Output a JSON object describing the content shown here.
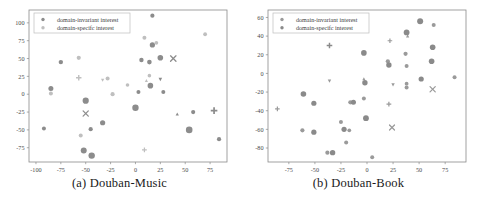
{
  "figure": {
    "background": "#ffffff",
    "panel_count": 2
  },
  "colors": {
    "invariant": "#8c8c8c",
    "specific": "#b8b8b8",
    "axis": "#8a8a8a",
    "text": "#3a3a3a",
    "legend_border": "#bdbdbd"
  },
  "legend": {
    "entries": [
      {
        "label": "domain-invariant interest",
        "marker": "circle",
        "color_key": "invariant"
      },
      {
        "label": "domain-specifc interest",
        "marker": "circle",
        "color_key": "specific"
      }
    ]
  },
  "chart_data": [
    {
      "type": "scatter",
      "panel": "a",
      "title": "(a) Douban-Music",
      "caption": "(a) Douban-Music",
      "xlabel": "",
      "ylabel": "",
      "grid": false,
      "legend_position": "upper-left",
      "xlim": [
        -107,
        92
      ],
      "ylim": [
        -95,
        118
      ],
      "xticks": [
        -100,
        -75,
        -50,
        -25,
        0,
        25,
        50,
        75
      ],
      "yticks": [
        100,
        75,
        50,
        25,
        0,
        -25,
        -50,
        -75
      ],
      "xticklabels": [
        "-100",
        "-75",
        "-50",
        "-25",
        "0",
        "25",
        "50",
        "75"
      ],
      "yticklabels": [
        "100",
        "75",
        "50",
        "25",
        "0",
        "-25",
        "-50",
        "-75"
      ],
      "series": [
        {
          "name": "domain-invariant interest",
          "color": "#8c8c8c",
          "points": [
            {
              "x": -85,
              "y": 8,
              "marker": "circle",
              "size": 5.0
            },
            {
              "x": -50,
              "y": -9,
              "marker": "circle",
              "size": 6.2
            },
            {
              "x": -52,
              "y": -79,
              "marker": "circle",
              "size": 6.0
            },
            {
              "x": -44,
              "y": -86,
              "marker": "circle",
              "size": 6.4
            },
            {
              "x": -33,
              "y": -40,
              "marker": "circle",
              "size": 5.2
            },
            {
              "x": 0,
              "y": -19,
              "marker": "circle",
              "size": 6.4
            },
            {
              "x": 15,
              "y": 12,
              "marker": "circle",
              "size": 5.6
            },
            {
              "x": 54,
              "y": -50,
              "marker": "circle",
              "size": 6.6
            },
            {
              "x": -50,
              "y": -27,
              "marker": "x",
              "size": 5.2
            },
            {
              "x": 38,
              "y": 50,
              "marker": "x",
              "size": 5.4
            },
            {
              "x": 25,
              "y": 21,
              "marker": "triangle-down",
              "size": 5.0
            },
            {
              "x": 42,
              "y": -28,
              "marker": "triangle-up",
              "size": 4.6
            },
            {
              "x": 79,
              "y": -23,
              "marker": "plus",
              "size": 6.6
            },
            {
              "x": 25,
              "y": 51,
              "marker": "circle",
              "size": 5.6
            },
            {
              "x": 17,
              "y": 69,
              "marker": "circle",
              "size": 5.2
            },
            {
              "x": 6,
              "y": 48,
              "marker": "circle",
              "size": 4.4
            },
            {
              "x": 14,
              "y": 45,
              "marker": "circle",
              "size": 4.6
            },
            {
              "x": -75,
              "y": 45,
              "marker": "circle",
              "size": 4.4
            },
            {
              "x": 3,
              "y": 3,
              "marker": "circle",
              "size": 4.0
            },
            {
              "x": 28,
              "y": 3,
              "marker": "circle",
              "size": 4.0
            },
            {
              "x": -45,
              "y": -49,
              "marker": "circle",
              "size": 4.2
            },
            {
              "x": -92,
              "y": -48,
              "marker": "circle",
              "size": 4.0
            },
            {
              "x": 58,
              "y": -25,
              "marker": "circle",
              "size": 4.2
            },
            {
              "x": 84,
              "y": -63,
              "marker": "circle",
              "size": 4.2
            },
            {
              "x": 17,
              "y": 110,
              "marker": "circle",
              "size": 4.2
            }
          ]
        },
        {
          "name": "domain-specifc interest",
          "color": "#bfbfbf",
          "points": [
            {
              "x": -85,
              "y": 1,
              "marker": "circle",
              "size": 4.0
            },
            {
              "x": -57,
              "y": 51,
              "marker": "circle",
              "size": 4.2
            },
            {
              "x": -57,
              "y": 23,
              "marker": "plus",
              "size": 5.4
            },
            {
              "x": -33,
              "y": 20,
              "marker": "triangle-down",
              "size": 4.6
            },
            {
              "x": -28,
              "y": 22,
              "marker": "circle",
              "size": 4.0
            },
            {
              "x": -23,
              "y": 0,
              "marker": "circle",
              "size": 4.2
            },
            {
              "x": -55,
              "y": -58,
              "marker": "circle",
              "size": 4.0
            },
            {
              "x": 9,
              "y": 79,
              "marker": "circle",
              "size": 4.0
            },
            {
              "x": 21,
              "y": 72,
              "marker": "circle",
              "size": 3.8
            },
            {
              "x": 11,
              "y": 19,
              "marker": "triangle-up",
              "size": 4.4
            },
            {
              "x": 14,
              "y": 26,
              "marker": "circle",
              "size": 3.6
            },
            {
              "x": 9,
              "y": -78,
              "marker": "plus",
              "size": 4.8
            },
            {
              "x": 70,
              "y": 84,
              "marker": "circle",
              "size": 3.8
            },
            {
              "x": -8,
              "y": 13,
              "marker": "circle",
              "size": 3.6
            }
          ]
        }
      ]
    },
    {
      "type": "scatter",
      "panel": "b",
      "title": "(b) Douban-Book",
      "caption": "(b) Douban-Book",
      "xlabel": "",
      "ylabel": "",
      "grid": false,
      "legend_position": "upper-left",
      "xlim": [
        -95,
        95
      ],
      "ylim": [
        -95,
        68
      ],
      "xticks": [
        -75,
        -50,
        -25,
        0,
        25,
        50,
        75
      ],
      "yticks": [
        60,
        40,
        20,
        0,
        -20,
        -40,
        -60,
        -80
      ],
      "xticklabels": [
        "-75",
        "-50",
        "-25",
        "0",
        "25",
        "50",
        "75"
      ],
      "yticklabels": [
        "60",
        "40",
        "20",
        "0",
        "-20",
        "-40",
        "-60",
        "-80"
      ],
      "series": [
        {
          "name": "domain-invariant interest",
          "color": "#9a9a9a",
          "points": [
            {
              "x": -86,
              "y": -38,
              "marker": "plus",
              "size": 4.6
            },
            {
              "x": -62,
              "y": -61,
              "marker": "circle",
              "size": 4.2
            },
            {
              "x": -16,
              "y": -31,
              "marker": "circle",
              "size": 4.2
            },
            {
              "x": -25,
              "y": -52,
              "marker": "circle",
              "size": 4.0
            },
            {
              "x": -20,
              "y": -74,
              "marker": "circle",
              "size": 4.0
            },
            {
              "x": -38,
              "y": -85,
              "marker": "circle",
              "size": 4.2
            },
            {
              "x": 5,
              "y": -90,
              "marker": "circle",
              "size": 4.0
            },
            {
              "x": 20,
              "y": 13,
              "marker": "circle",
              "size": 4.2
            },
            {
              "x": 22,
              "y": 35,
              "marker": "plus",
              "size": 4.6
            },
            {
              "x": 37,
              "y": 21,
              "marker": "circle",
              "size": 4.2
            },
            {
              "x": 38,
              "y": 8,
              "marker": "circle",
              "size": 4.0
            },
            {
              "x": 38,
              "y": -15,
              "marker": "circle",
              "size": 4.0
            },
            {
              "x": 21,
              "y": -33,
              "marker": "plus",
              "size": 4.8
            },
            {
              "x": 24,
              "y": -58,
              "marker": "x",
              "size": 5.0
            },
            {
              "x": 63,
              "y": -17,
              "marker": "x",
              "size": 5.2
            },
            {
              "x": 84,
              "y": -4,
              "marker": "circle",
              "size": 4.0
            },
            {
              "x": 64,
              "y": 52,
              "marker": "circle",
              "size": 4.0
            },
            {
              "x": 39,
              "y": 40,
              "marker": "triangle-up",
              "size": 4.6
            },
            {
              "x": -3,
              "y": -6,
              "marker": "triangle-up",
              "size": 4.4
            },
            {
              "x": 25,
              "y": -12,
              "marker": "triangle-down",
              "size": 4.8
            },
            {
              "x": -36,
              "y": -8,
              "marker": "triangle-down",
              "size": 4.8
            },
            {
              "x": 38,
              "y": -11,
              "marker": "circle",
              "size": 3.8
            },
            {
              "x": -3,
              "y": -27,
              "marker": "circle",
              "size": 4.0
            },
            {
              "x": -14,
              "y": -31,
              "marker": "circle",
              "size": 3.8
            },
            {
              "x": -17,
              "y": -61,
              "marker": "circle",
              "size": 3.8
            }
          ]
        },
        {
          "name": "domain-specifc interest",
          "color": "#8a8a8a",
          "points": [
            {
              "x": -61,
              "y": -22,
              "marker": "circle",
              "size": 5.6
            },
            {
              "x": -51,
              "y": -32,
              "marker": "circle",
              "size": 5.2
            },
            {
              "x": -51,
              "y": -63,
              "marker": "circle",
              "size": 5.2
            },
            {
              "x": -33,
              "y": -85,
              "marker": "circle",
              "size": 5.4
            },
            {
              "x": -22,
              "y": -60,
              "marker": "circle",
              "size": 5.2
            },
            {
              "x": -1,
              "y": -48,
              "marker": "circle",
              "size": 5.8
            },
            {
              "x": -2,
              "y": -10,
              "marker": "circle",
              "size": 5.4
            },
            {
              "x": -3,
              "y": 22,
              "marker": "circle",
              "size": 5.6
            },
            {
              "x": -36,
              "y": 30,
              "marker": "plus",
              "size": 5.6
            },
            {
              "x": 21,
              "y": 9,
              "marker": "circle",
              "size": 5.4
            },
            {
              "x": 38,
              "y": 44,
              "marker": "circle",
              "size": 5.8
            },
            {
              "x": 51,
              "y": 56,
              "marker": "circle",
              "size": 6.0
            },
            {
              "x": 63,
              "y": 28,
              "marker": "circle",
              "size": 5.6
            },
            {
              "x": 62,
              "y": 13,
              "marker": "circle",
              "size": 5.6
            },
            {
              "x": 52,
              "y": -6,
              "marker": "circle",
              "size": 5.2
            },
            {
              "x": -13,
              "y": -31,
              "marker": "circle",
              "size": 5.0
            }
          ]
        }
      ]
    }
  ]
}
